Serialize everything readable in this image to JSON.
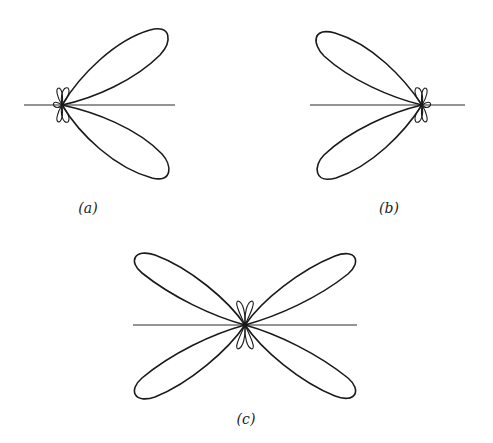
{
  "figure": {
    "panels": [
      {
        "id": "a",
        "label": "(a)",
        "direction": "right",
        "main_lobes": 2,
        "minor_lobes": 4
      },
      {
        "id": "b",
        "label": "(b)",
        "direction": "left",
        "main_lobes": 2,
        "minor_lobes": 4
      },
      {
        "id": "c",
        "label": "(c)",
        "direction": "both",
        "main_lobes": 4,
        "minor_lobes": 2
      }
    ]
  },
  "colors": {
    "stroke": "#1a1a1a",
    "background": "#ffffff"
  }
}
